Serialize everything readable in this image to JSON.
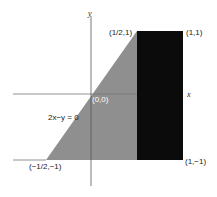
{
  "diagram": {
    "colors": {
      "background": "#ffffff",
      "gray_region": "#8f8f8f",
      "black_region": "#0b0b0b",
      "axis": "#555555",
      "label_on_dark": "#ffffff"
    },
    "axes": {
      "x_label": "x",
      "y_label": "y"
    },
    "points": {
      "origin": "(0,0)",
      "half_one": "(1/2,1)",
      "one_one": "(1,1)",
      "one_neg_one": "(1,−1)",
      "neg_half_neg_one": "(−1/2,−1)"
    },
    "line_label": "2x−y = 0"
  }
}
